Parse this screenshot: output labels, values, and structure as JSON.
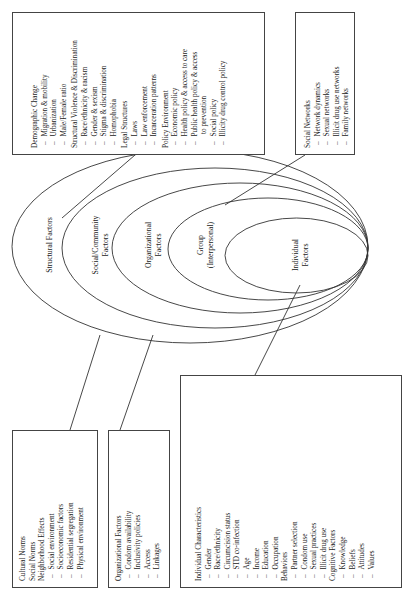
{
  "diagram": {
    "type": "nested-ellipse-socioecological-model",
    "levels": [
      {
        "id": "structural",
        "label_lines": [
          "Structural Factors"
        ]
      },
      {
        "id": "social",
        "label_lines": [
          "Social/Community",
          "Factors"
        ]
      },
      {
        "id": "organizational",
        "label_lines": [
          "Organizational",
          "Factors"
        ]
      },
      {
        "id": "group",
        "label_lines": [
          "Group",
          "(Interpersonal)"
        ]
      },
      {
        "id": "individual",
        "label_lines": [
          "Individual",
          "Factors"
        ]
      }
    ],
    "boxes": {
      "cultural": {
        "groups": [
          {
            "heading": "Cultural Norms",
            "items": []
          },
          {
            "heading": "Social Norms",
            "items": []
          },
          {
            "heading": "Neighborhood Effects",
            "items": [
              "Social environment",
              "Socioeconomic factors",
              "Residential segregation",
              "Physical environment"
            ]
          }
        ]
      },
      "organizational": {
        "groups": [
          {
            "heading": "Organizational Factors",
            "items": [
              "Condom availability",
              "Inclusivity policies",
              "Access",
              "Linkages"
            ]
          }
        ]
      },
      "individual": {
        "groups": [
          {
            "heading": "Individual Characteristics",
            "items": [
              "Gender",
              "Race/ethnicity",
              "Circumcision status",
              "STD co-infection",
              "Age",
              "Income",
              "Education",
              "Occupation"
            ]
          },
          {
            "heading": "Behaviors",
            "items": [
              "Partner selection",
              "Condom use",
              "Sexual practices",
              "Illicit drug use"
            ]
          },
          {
            "heading": "Cognitive Factors",
            "items": [
              "Knowledge",
              "Beliefs",
              "Attitudes",
              "Values"
            ]
          }
        ]
      },
      "structural": {
        "groups": [
          {
            "heading": "Demographic Change",
            "items": [
              "Migration & mobility",
              "Urbanization",
              "Male/Female ratio"
            ]
          },
          {
            "heading": "Structural Violence & Discrimination",
            "items": [
              "Race/ethnicity & racism",
              "Gender & sexism",
              "Stigma & discrimination",
              "Homophobia"
            ]
          },
          {
            "heading": "Legal Structures",
            "items": [
              "Laws",
              "Law enforcement",
              "Incarceration patterns"
            ]
          },
          {
            "heading": "Policy Environment",
            "items": [
              "Economic policy",
              "Health policy & access to care",
              "Public health policy & access",
              "to prevention",
              "Social policy",
              "Illicity drug control policy"
            ]
          }
        ]
      },
      "social_networks": {
        "groups": [
          {
            "heading": "Social Networks",
            "items": [
              "Network dynamics",
              "Sexual networks",
              "Illicit drug use networks",
              "Family networks"
            ]
          }
        ]
      }
    },
    "colors": {
      "stroke": "#333333",
      "text": "#222222",
      "background": "#ffffff"
    }
  }
}
